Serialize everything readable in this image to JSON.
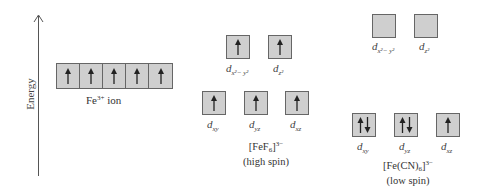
{
  "axis": {
    "label": "Energy",
    "direction": "up"
  },
  "free_ion": {
    "label_base": "Fe",
    "label_sup": "3+",
    "label_rest": " ion",
    "orbitals": [
      "up",
      "up",
      "up",
      "up",
      "up"
    ]
  },
  "high_spin": {
    "complex_base": "[FeF",
    "complex_sub": "6",
    "complex_close": "]",
    "complex_charge": "3−",
    "spin_label": "(high spin)",
    "eg": [
      {
        "name": "dx2-y2",
        "d": "d",
        "sub": "x²− y²",
        "electrons": "up"
      },
      {
        "name": "dz2",
        "d": "d",
        "sub": "z²",
        "electrons": "up"
      }
    ],
    "t2g": [
      {
        "name": "dxy",
        "d": "d",
        "sub": "xy",
        "electrons": "up"
      },
      {
        "name": "dyz",
        "d": "d",
        "sub": "yz",
        "electrons": "up"
      },
      {
        "name": "dxz",
        "d": "d",
        "sub": "xz",
        "electrons": "up"
      }
    ]
  },
  "low_spin": {
    "complex_base": "[Fe(CN)",
    "complex_sub": "6",
    "complex_close": "]",
    "complex_charge": "3−",
    "spin_label": "(low spin)",
    "eg": [
      {
        "name": "dx2-y2",
        "d": "d",
        "sub": "x²− y²",
        "electrons": "empty"
      },
      {
        "name": "dz2",
        "d": "d",
        "sub": "z²",
        "electrons": "empty"
      }
    ],
    "t2g": [
      {
        "name": "dxy",
        "d": "d",
        "sub": "xy",
        "electrons": "pair"
      },
      {
        "name": "dyz",
        "d": "d",
        "sub": "yz",
        "electrons": "pair"
      },
      {
        "name": "dxz",
        "d": "d",
        "sub": "xz",
        "electrons": "up"
      }
    ]
  },
  "colors": {
    "box_fill": "#cfcfcf",
    "box_border": "#666666",
    "arrow": "#222222"
  }
}
